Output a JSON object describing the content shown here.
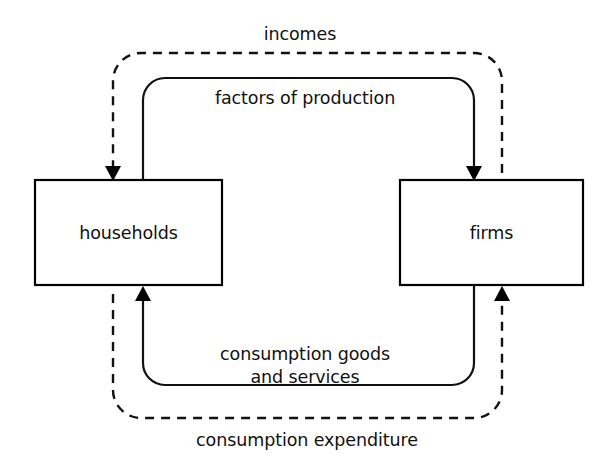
{
  "diagram": {
    "type": "circular-flow-diagram",
    "background_color": "#ffffff",
    "line_color": "#111111",
    "nodes": [
      {
        "id": "households",
        "label": "households",
        "x": 35,
        "y": 180,
        "width": 187,
        "height": 105
      },
      {
        "id": "firms",
        "label": "firms",
        "x": 400,
        "y": 180,
        "width": 183,
        "height": 105
      }
    ],
    "flows": [
      {
        "id": "incomes",
        "label": "incomes",
        "style": "dashed",
        "from": "firms",
        "to": "households",
        "path": "outer-top",
        "label_x": 300,
        "label_y": 40
      },
      {
        "id": "factors-of-production",
        "label": "factors of production",
        "style": "solid",
        "from": "households",
        "to": "firms",
        "path": "inner-top",
        "label_x": 305,
        "label_y": 104
      },
      {
        "id": "consumption-goods-and-services",
        "label_line_1": "consumption goods",
        "label_line_2": "and services",
        "style": "solid",
        "from": "firms",
        "to": "households",
        "path": "inner-bottom",
        "label_x": 305,
        "label_y": 360,
        "label_y_2": 383
      },
      {
        "id": "consumption-expenditure",
        "label": "consumption expenditure",
        "style": "dashed",
        "from": "households",
        "to": "firms",
        "path": "outer-bottom",
        "label_x": 307,
        "label_y": 446
      }
    ],
    "arrowheads": [
      {
        "id": "arrow-incomes-into-households",
        "x": 113,
        "y": 180,
        "direction": "down"
      },
      {
        "id": "arrow-factors-into-firms",
        "x": 474,
        "y": 180,
        "direction": "down"
      },
      {
        "id": "arrow-goods-into-households",
        "x": 143,
        "y": 287,
        "direction": "up"
      },
      {
        "id": "arrow-expenditure-into-firms",
        "x": 502,
        "y": 287,
        "direction": "up"
      }
    ]
  }
}
